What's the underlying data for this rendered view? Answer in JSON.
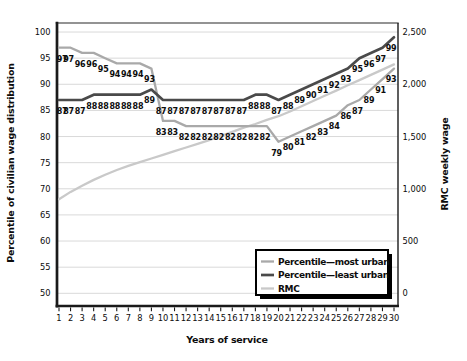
{
  "figure": {
    "kind": "dual-axis line chart",
    "x_axis_title": "Years of service",
    "left_axis_title": "Percentile of civilian wage distribution",
    "right_axis_title": "RMC weekly wage"
  },
  "chart_data": {
    "type": "line",
    "title": "",
    "xlabel": "Years of service",
    "ylabel_left": "Percentile of civilian wage distribution",
    "ylabel_right": "RMC weekly wage",
    "x": [
      1,
      2,
      3,
      4,
      5,
      6,
      7,
      8,
      9,
      10,
      11,
      12,
      13,
      14,
      15,
      16,
      17,
      18,
      19,
      20,
      21,
      22,
      23,
      24,
      25,
      26,
      27,
      28,
      29,
      30
    ],
    "ylim_left": [
      50,
      100
    ],
    "ylim_right": [
      0,
      2500
    ],
    "yticks_left": [
      50,
      55,
      60,
      65,
      70,
      75,
      80,
      85,
      90,
      95,
      100
    ],
    "yticks_right": {
      "values": [
        0,
        500,
        1000,
        1500,
        2000,
        2500
      ],
      "labels": [
        "0",
        "500",
        "1,000",
        "1,500",
        "2,000",
        "2,500"
      ]
    },
    "grid": true,
    "legend_position": "bottom-right",
    "series": [
      {
        "name": "Percentile—most urban",
        "axis": "left",
        "color": "#a9a9a9",
        "width": 2.3,
        "point_labels": true,
        "values": [
          97,
          97,
          96,
          96,
          95,
          94,
          94,
          94,
          93,
          83,
          83,
          82,
          82,
          82,
          82,
          82,
          82,
          82,
          82,
          79,
          80,
          81,
          82,
          83,
          84,
          86,
          87,
          89,
          91,
          93
        ]
      },
      {
        "name": "Percentile—least urban",
        "axis": "left",
        "color": "#4a4a4a",
        "width": 2.7,
        "point_labels": true,
        "values": [
          87,
          87,
          87,
          88,
          88,
          88,
          88,
          88,
          89,
          87,
          87,
          87,
          87,
          87,
          87,
          87,
          87,
          88,
          88,
          87,
          88,
          89,
          90,
          91,
          92,
          93,
          95,
          96,
          97,
          99
        ]
      },
      {
        "name": "RMC",
        "axis": "right",
        "color": "#c9c9c9",
        "width": 2.3,
        "point_labels": false,
        "values": [
          900,
          970,
          1030,
          1085,
          1135,
          1180,
          1220,
          1255,
          1290,
          1325,
          1360,
          1395,
          1430,
          1465,
          1505,
          1545,
          1585,
          1620,
          1660,
          1695,
          1740,
          1790,
          1840,
          1890,
          1940,
          1990,
          2040,
          2090,
          2140,
          2190
        ]
      }
    ],
    "colors": {
      "grid": "#d9d9d9",
      "axis": "#1a1a1a",
      "top_border": "#939393",
      "label_text": "#0d0d0d",
      "legend_shadow": "#000000",
      "legend_border": "#000000",
      "legend_fill": "#ffffff"
    }
  }
}
